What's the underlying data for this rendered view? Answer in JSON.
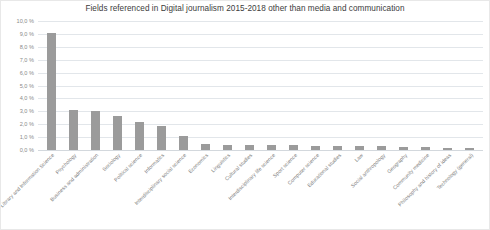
{
  "chart_data": {
    "type": "bar",
    "title": "Fields referenced in Digital journalism 2015-2018 other than media and communication",
    "xlabel": "",
    "ylabel": "",
    "ylim": [
      0,
      10
    ],
    "grid": true,
    "legend": "none",
    "bar_color": "#9b9b9b",
    "gridline_color": "#e2e6ea",
    "ytick_labels": [
      "10,0 %",
      "9,0 %",
      "8,0 %",
      "7,0 %",
      "6,0 %",
      "5,0 %",
      "4,0 %",
      "3,0 %",
      "2,0 %",
      "1,0 %",
      "0,0 %"
    ],
    "ytick_values": [
      10,
      9,
      8,
      7,
      6,
      5,
      4,
      3,
      2,
      1,
      0
    ],
    "categories": [
      "Library and Information Science",
      "Psychology",
      "Business and administration",
      "Sociology",
      "Political science",
      "Informatics",
      "Interdisciplinary social science",
      "Economics",
      "Linguistics",
      "Cultural studies",
      "Interdisciplinary life science",
      "Sport science",
      "Computer science",
      "Educational studies",
      "Law",
      "Social anthropology",
      "Geography",
      "Community medicine",
      "Philosophy and history of ideas",
      "Technology (general)"
    ],
    "values": [
      9.1,
      3.1,
      3.05,
      2.6,
      2.15,
      1.85,
      1.1,
      0.5,
      0.4,
      0.4,
      0.38,
      0.36,
      0.34,
      0.32,
      0.3,
      0.28,
      0.24,
      0.2,
      0.18,
      0.15
    ]
  }
}
